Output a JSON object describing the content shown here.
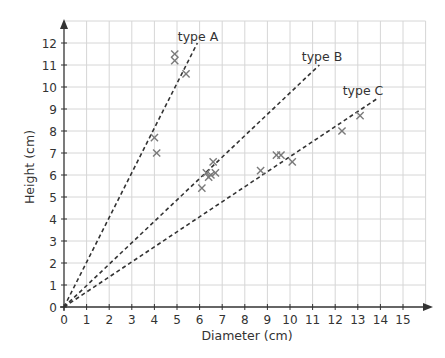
{
  "chart_data": {
    "type": "scatter",
    "title": "",
    "xlabel": "Diameter (cm)",
    "ylabel": "Height (cm)",
    "xlim": [
      0,
      16
    ],
    "ylim": [
      0,
      13
    ],
    "xticks": [
      0,
      1,
      2,
      3,
      4,
      5,
      6,
      7,
      8,
      9,
      10,
      11,
      12,
      13,
      14,
      15
    ],
    "yticks": [
      0,
      1,
      2,
      3,
      4,
      5,
      6,
      7,
      8,
      9,
      10,
      11,
      12
    ],
    "grid": true,
    "legend": "none (lines labelled inline)",
    "marker": "x",
    "points": [
      {
        "x": 4.9,
        "y": 11.5
      },
      {
        "x": 4.9,
        "y": 11.2
      },
      {
        "x": 5.4,
        "y": 10.6
      },
      {
        "x": 4.0,
        "y": 7.7
      },
      {
        "x": 4.1,
        "y": 7.0
      },
      {
        "x": 6.6,
        "y": 6.6
      },
      {
        "x": 6.3,
        "y": 6.1
      },
      {
        "x": 6.4,
        "y": 5.9
      },
      {
        "x": 6.5,
        "y": 6.0
      },
      {
        "x": 6.7,
        "y": 6.1
      },
      {
        "x": 6.1,
        "y": 5.4
      },
      {
        "x": 8.7,
        "y": 6.2
      },
      {
        "x": 9.4,
        "y": 6.9
      },
      {
        "x": 9.6,
        "y": 6.9
      },
      {
        "x": 10.1,
        "y": 6.6
      },
      {
        "x": 12.3,
        "y": 8.0
      },
      {
        "x": 13.1,
        "y": 8.7
      }
    ],
    "series": [
      {
        "name": "type A",
        "style": "dashed",
        "x": [
          0,
          5.9
        ],
        "y": [
          0,
          12.0
        ],
        "label_pos": [
          5.9,
          12.3
        ]
      },
      {
        "name": "type B",
        "style": "dashed",
        "x": [
          0,
          11.3
        ],
        "y": [
          0,
          11.0
        ],
        "label_pos": [
          11.5,
          11.3
        ]
      },
      {
        "name": "type C",
        "style": "dashed",
        "x": [
          0,
          13.9
        ],
        "y": [
          0,
          9.5
        ],
        "label_pos": [
          13.3,
          9.8
        ]
      }
    ]
  },
  "labels": {
    "xlabel": "Diameter (cm)",
    "ylabel": "Height (cm)",
    "type_a": "type A",
    "type_b": "type B",
    "type_c": "type C"
  },
  "colors": {
    "axis": "#333333",
    "grid": "#d6d6d6",
    "marker": "#7a7a7a",
    "trend": "#333333"
  }
}
